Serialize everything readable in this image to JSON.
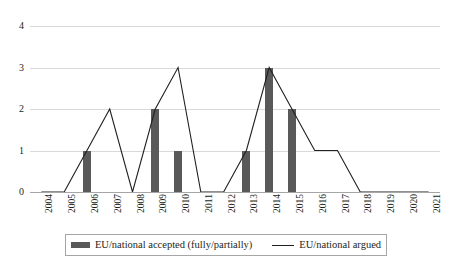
{
  "chart_data": {
    "type": "bar",
    "title": "",
    "subtitle": "",
    "xlabel": "",
    "ylabel": "",
    "categories": [
      "2004",
      "2005",
      "2006",
      "2007",
      "2008",
      "2009",
      "2010",
      "2011",
      "2012",
      "2013",
      "2014",
      "2015",
      "2016",
      "2017",
      "2018",
      "2019",
      "2020",
      "2021"
    ],
    "ylim": [
      0,
      4
    ],
    "yticks": [
      0,
      1,
      2,
      3,
      4
    ],
    "grid": true,
    "legend_position": "bottom",
    "series": [
      {
        "name": "EU/national accepted (fully/partially)",
        "type": "bar",
        "color": "#595959",
        "values": [
          0,
          0,
          1,
          0,
          0,
          2,
          1,
          0,
          0,
          1,
          3,
          2,
          0,
          0,
          0,
          0,
          0,
          0
        ]
      },
      {
        "name": "EU/national argued",
        "type": "line",
        "color": "#231f20",
        "values": [
          0,
          0,
          1,
          2,
          0,
          2,
          3,
          0,
          0,
          1,
          3,
          2,
          1,
          1,
          0,
          0,
          0,
          0
        ]
      }
    ]
  },
  "axes": {
    "y_tick_labels": [
      "0",
      "1",
      "2",
      "3",
      "4"
    ],
    "x_tick_labels": [
      "2004",
      "2005",
      "2006",
      "2007",
      "2008",
      "2009",
      "2010",
      "2011",
      "2012",
      "2013",
      "2014",
      "2015",
      "2016",
      "2017",
      "2018",
      "2019",
      "2020",
      "2021"
    ]
  },
  "legend": {
    "entries": [
      {
        "label": "EU/national accepted (fully/partially)",
        "marker": "bar-swatch",
        "color": "#595959"
      },
      {
        "label": "EU/national argued",
        "marker": "line-swatch",
        "color": "#231f20"
      }
    ]
  },
  "colors": {
    "bar": "#595959",
    "line": "#231f20",
    "gridline": "#d9d9d9",
    "baseline": "#a6a6a6",
    "background": "#ffffff",
    "text": "#231f20"
  }
}
